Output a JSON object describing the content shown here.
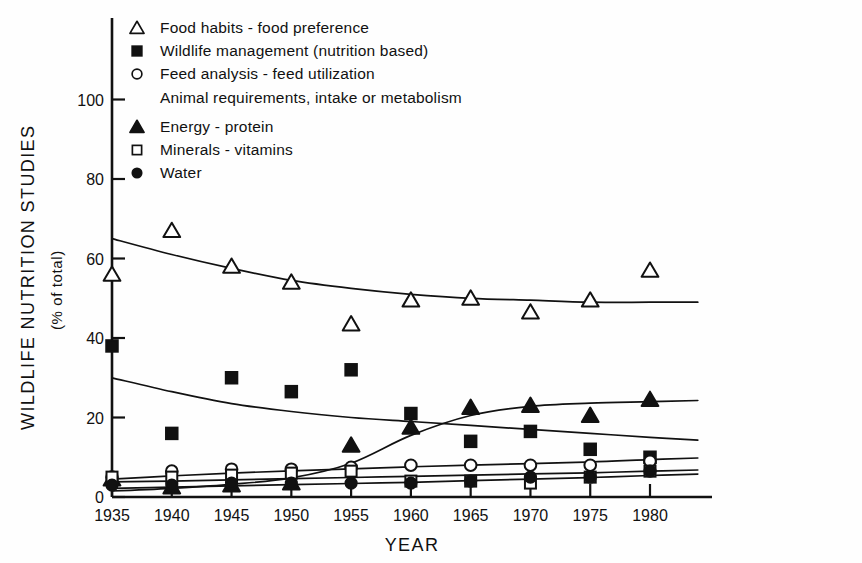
{
  "figure": {
    "background": "#fefefe",
    "ink": "#111111"
  },
  "axes": {
    "y_title": "WILDLIFE NUTRITION STUDIES",
    "y_subtitle": "(% of total)",
    "x_title": "YEAR",
    "y_ticks": [
      "0",
      "20",
      "40",
      "60",
      "80",
      "100"
    ],
    "x_ticks": [
      "1935",
      "1940",
      "1945",
      "1950",
      "1955",
      "1960",
      "1965",
      "1970",
      "1975",
      "1980"
    ]
  },
  "legend": {
    "entries": [
      {
        "marker": "open-triangle",
        "label": "Food habits - food preference"
      },
      {
        "marker": "filled-square",
        "label": "Wildlife management (nutrition based)"
      },
      {
        "marker": "open-circle",
        "label": "Feed analysis - feed utilization"
      },
      {
        "marker": "none",
        "label": "Animal requirements, intake or metabolism"
      },
      {
        "marker": "filled-triangle",
        "label": "Energy - protein"
      },
      {
        "marker": "open-square",
        "label": "Minerals - vitamins"
      },
      {
        "marker": "filled-circle",
        "label": "Water"
      }
    ]
  },
  "chart_data": {
    "type": "scatter",
    "title": "",
    "xlabel": "YEAR",
    "ylabel": "WILDLIFE NUTRITION STUDIES (% of total)",
    "xlim": [
      1933,
      1983
    ],
    "ylim": [
      0,
      108
    ],
    "grid": false,
    "legend_position": "top-left",
    "x": [
      1935,
      1940,
      1945,
      1950,
      1955,
      1960,
      1965,
      1970,
      1975,
      1980
    ],
    "series": [
      {
        "name": "Food habits - food preference",
        "marker": "open-triangle",
        "values": [
          56,
          67,
          58,
          54,
          43.5,
          49.5,
          50,
          46.5,
          49.5,
          57
        ],
        "trend": [
          65,
          61,
          57.5,
          54.5,
          52.5,
          51,
          50,
          49.5,
          49,
          49
        ]
      },
      {
        "name": "Wildlife management (nutrition based)",
        "marker": "filled-square",
        "values": [
          38,
          16,
          30,
          26.5,
          32,
          21,
          14,
          16.5,
          12,
          10
        ],
        "trend": [
          30,
          26.5,
          23.5,
          21.5,
          20,
          19,
          18,
          17,
          16,
          15
        ]
      },
      {
        "name": "Feed analysis - feed utilization",
        "marker": "open-circle",
        "values": [
          5,
          6.5,
          7,
          7,
          7.5,
          8,
          8,
          8,
          8,
          9
        ],
        "trend": [
          4.5,
          5.3,
          6.0,
          6.6,
          7.1,
          7.6,
          8.0,
          8.4,
          8.8,
          9.4
        ]
      },
      {
        "name": "Energy - protein",
        "marker": "filled-triangle",
        "values": [
          4.5,
          2.5,
          3,
          3.5,
          13,
          17.5,
          22.5,
          23,
          20.5,
          24.5
        ],
        "trend": [
          1.5,
          2.2,
          3.2,
          4.8,
          8.5,
          15.5,
          20.5,
          22.8,
          23.6,
          24
        ]
      },
      {
        "name": "Minerals - vitamins",
        "marker": "open-square",
        "values": [
          5,
          5,
          5.5,
          6,
          6.5,
          4,
          4,
          3.5,
          5,
          6.5
        ],
        "trend": [
          3.8,
          4.0,
          4.3,
          4.6,
          4.9,
          5.2,
          5.5,
          5.8,
          6.1,
          6.5
        ]
      },
      {
        "name": "Water",
        "marker": "filled-circle",
        "values": [
          3,
          3,
          3.5,
          3.5,
          3.5,
          3.5,
          4,
          5,
          5,
          6.5
        ],
        "trend": [
          2.2,
          2.5,
          2.8,
          3.1,
          3.4,
          3.7,
          4.1,
          4.5,
          4.9,
          5.4
        ]
      }
    ]
  }
}
